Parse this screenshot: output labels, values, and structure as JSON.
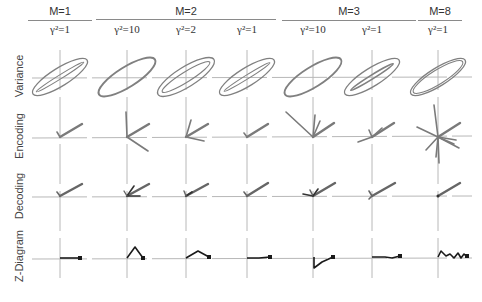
{
  "figure": {
    "groups": [
      {
        "label": "M=1",
        "x_start": 28,
        "x_end": 92,
        "center": 60
      },
      {
        "label": "M=2",
        "x_start": 96,
        "x_end": 276,
        "center": 186
      },
      {
        "label": "M=3",
        "x_start": 282,
        "x_end": 416,
        "center": 350
      },
      {
        "label": "M=8",
        "x_start": 418,
        "x_end": 462,
        "center": 438
      }
    ],
    "columns": [
      {
        "gamma_label": "γ²=1",
        "center": 60
      },
      {
        "gamma_label": "γ²=10",
        "center": 127
      },
      {
        "gamma_label": "γ²=2",
        "center": 186
      },
      {
        "gamma_label": "γ²=1",
        "center": 247
      },
      {
        "gamma_label": "γ²=10",
        "center": 313
      },
      {
        "gamma_label": "γ²=1",
        "center": 372
      },
      {
        "gamma_label": "γ²=1",
        "center": 438
      }
    ],
    "rows": [
      {
        "label": "Variance",
        "axis_y": 77
      },
      {
        "label": "Encoding",
        "axis_y": 137
      },
      {
        "label": "Decoding",
        "axis_y": 196
      },
      {
        "label": "Z-Diagram",
        "axis_y": 258
      }
    ],
    "colors": {
      "axis": "#b5b5b5",
      "vector": "#7a7a7a",
      "ellipse": "#7f7f7f",
      "z_path": "#1a1a1a",
      "rule": "#8a8a8a"
    }
  }
}
